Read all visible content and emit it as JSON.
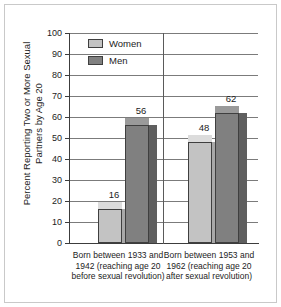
{
  "chart_data": {
    "type": "bar",
    "title": "",
    "xlabel": "",
    "ylabel": "Percent Reporting Two or More Sexual Partners by Age 20",
    "ylim": [
      0,
      100
    ],
    "ytick_step": 10,
    "yticks": [
      100,
      90,
      80,
      70,
      60,
      50,
      40,
      30,
      20,
      10,
      0
    ],
    "grid": true,
    "legend_position": "top-left-inside",
    "categories": [
      "Born between 1933 and 1942 (reaching age 20 before sexual revolution)",
      "Born between 1953 and 1962 (reaching age 20 after sexual revolution)"
    ],
    "series": [
      {
        "name": "Women",
        "color": "#c3c3c3",
        "values": [
          16,
          48
        ]
      },
      {
        "name": "Men",
        "color": "#808080",
        "values": [
          56,
          62
        ]
      }
    ]
  },
  "legend": {
    "items": [
      {
        "label": "Women"
      },
      {
        "label": "Men"
      }
    ]
  },
  "axis": {
    "y_title": "Percent Reporting Two or More Sexual Partners by Age 20",
    "ticks": [
      "100",
      "90",
      "80",
      "70",
      "60",
      "50",
      "40",
      "30",
      "20",
      "10",
      "0"
    ]
  },
  "bars": [
    {
      "value_label": "16"
    },
    {
      "value_label": "56"
    },
    {
      "value_label": "48"
    },
    {
      "value_label": "62"
    }
  ],
  "categories": [
    {
      "label": "Born between 1933 and 1942 (reaching age 20 before sexual revolution)"
    },
    {
      "label": "Born between 1953 and 1962 (reaching age 20 after sexual revolution)"
    }
  ]
}
